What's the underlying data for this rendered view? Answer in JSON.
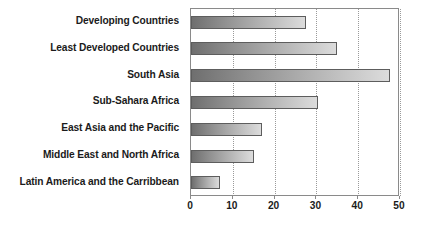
{
  "chart": {
    "title": "",
    "orientation": "horizontal"
  },
  "chart_data": {
    "type": "bar",
    "title": "",
    "xlabel": "",
    "ylabel": "",
    "orientation": "horizontal",
    "grid": true,
    "legend": false,
    "xlim": [
      0,
      50
    ],
    "xticks": [
      "0",
      "10",
      "20",
      "30",
      "40",
      "50"
    ],
    "xtick_values": [
      0,
      10,
      20,
      30,
      40,
      50
    ],
    "categories": [
      "Developing Countries",
      "Least Developed Countries",
      "South Asia",
      "Sub-Sahara Africa",
      "East Asia and the Pacific",
      "Middle East and North Africa",
      "Latin America and the Carribbean"
    ],
    "values": [
      27.5,
      35,
      47.5,
      30.5,
      17,
      15,
      7
    ]
  },
  "colors": {
    "bar_gradient_start": "#6f6f6f",
    "bar_gradient_end": "#dcdcdc",
    "bar_border": "#5d5d5d",
    "axis": "#8a8a8a",
    "gridline": "#9a9a9a",
    "text": "#1b1b1b",
    "background": "#ffffff"
  }
}
